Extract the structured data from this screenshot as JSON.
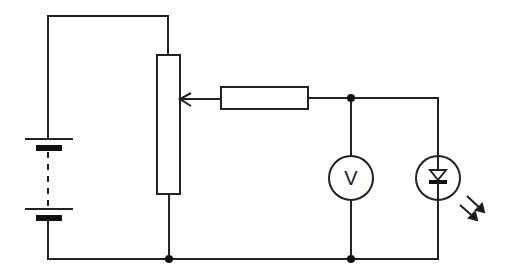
{
  "diagram": {
    "type": "circuit",
    "components": [
      {
        "id": "battery",
        "kind": "multi-cell battery"
      },
      {
        "id": "potentiometer",
        "kind": "variable resistor (rheostat) with slider"
      },
      {
        "id": "resistor",
        "kind": "fixed resistor"
      },
      {
        "id": "voltmeter",
        "kind": "voltmeter",
        "label": "V"
      },
      {
        "id": "photodiode",
        "kind": "photodiode with incident light arrows"
      },
      {
        "id": "junctions",
        "count": 3
      }
    ],
    "colors": {
      "line": "#222222",
      "background": "#ffffff"
    }
  }
}
